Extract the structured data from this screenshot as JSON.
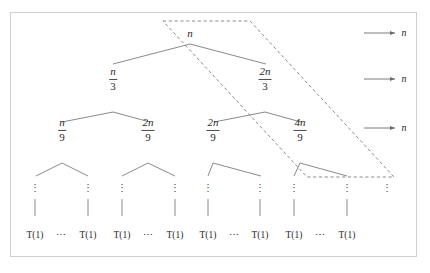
{
  "figure": {
    "kind": "recursion-tree",
    "border_color": "#cfcfcf",
    "background": "#ffffff",
    "line_color": "#6b6b6b",
    "dashed_color": "#8a8a8a",
    "text_color": "#2a2a2a"
  },
  "tree": {
    "root": {
      "label": "n",
      "x": 190,
      "y": 33
    },
    "level1": [
      {
        "numerator": "n",
        "denominator": "3",
        "x": 113,
        "y": 79
      },
      {
        "numerator": "2n",
        "denominator": "3",
        "x": 265,
        "y": 79
      }
    ],
    "level2": [
      {
        "numerator": "n",
        "denominator": "9",
        "x": 62,
        "y": 130
      },
      {
        "numerator": "2n",
        "denominator": "9",
        "x": 148,
        "y": 130
      },
      {
        "numerator": "2n",
        "denominator": "9",
        "x": 213,
        "y": 130
      },
      {
        "numerator": "4n",
        "denominator": "9",
        "x": 300,
        "y": 130
      }
    ],
    "vdots_symbol": "⋮",
    "vdots_x": [
      35,
      88,
      122,
      175,
      208,
      260,
      294,
      347,
      387
    ],
    "vdots_y": 188,
    "stem_y_top": 199,
    "stem_y_bottom": 216,
    "leaves": [
      {
        "label": "T(1)",
        "x": 35,
        "y": 236
      },
      {
        "label": "T(1)",
        "x": 88,
        "y": 236
      },
      {
        "label": "T(1)",
        "x": 122,
        "y": 236
      },
      {
        "label": "T(1)",
        "x": 175,
        "y": 236
      },
      {
        "label": "T(1)",
        "x": 208,
        "y": 236
      },
      {
        "label": "T(1)",
        "x": 260,
        "y": 236
      },
      {
        "label": "T(1)",
        "x": 294,
        "y": 236
      },
      {
        "label": "T(1)",
        "x": 347,
        "y": 236
      }
    ],
    "ellipses": [
      {
        "label": "⋯",
        "x": 61,
        "y": 236
      },
      {
        "label": "⋯",
        "x": 148,
        "y": 236
      },
      {
        "label": "⋯",
        "x": 234,
        "y": 236
      },
      {
        "label": "⋯",
        "x": 320,
        "y": 236
      }
    ]
  },
  "annotations": [
    {
      "label": "n",
      "x": 404,
      "y": 33,
      "arrow_x1": 364,
      "arrow_x2": 396
    },
    {
      "label": "n",
      "x": 404,
      "y": 79,
      "arrow_x1": 364,
      "arrow_x2": 396
    },
    {
      "label": "n",
      "x": 404,
      "y": 128,
      "arrow_x1": 364,
      "arrow_x2": 396
    }
  ],
  "highlight": {
    "shape": "parallelogram",
    "style": "dashed",
    "points": [
      [
        163,
        21
      ],
      [
        250,
        21
      ],
      [
        394,
        177
      ],
      [
        307,
        177
      ]
    ]
  }
}
